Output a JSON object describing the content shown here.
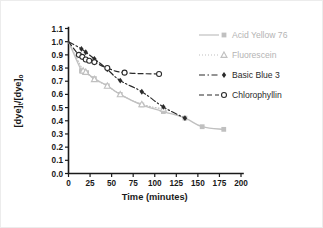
{
  "figure": {
    "background": "#ffffff",
    "border_color": "#ececec"
  },
  "axes": {
    "x": {
      "title": "Time (minutes)",
      "ticks": [
        "0",
        "25",
        "50",
        "75",
        "100",
        "125",
        "150",
        "175",
        "200"
      ],
      "min": 0,
      "max": 200
    },
    "y": {
      "title_main": "[dye]",
      "title_sub_t": "t",
      "title_slash": "/[dye]",
      "title_sub_o": "o",
      "ticks": [
        "0.0",
        "0.1",
        "0.2",
        "0.3",
        "0.4",
        "0.5",
        "0.6",
        "0.7",
        "0.8",
        "0.9",
        "1.0",
        "1.1"
      ],
      "min": 0.0,
      "max": 1.1
    }
  },
  "legend": {
    "entries": [
      {
        "label": "Acid Yellow 76",
        "color": "#c0c0c0",
        "text_color": "#b4b4b4",
        "dash": "none",
        "marker": "filled-square"
      },
      {
        "label": "Fluorescein",
        "color": "#c0c0c0",
        "text_color": "#b4b4b4",
        "dash": "dotted",
        "marker": "open-triangle"
      },
      {
        "label": "Basic Blue 3",
        "color": "#2b2b2b",
        "text_color": "#2b2b2b",
        "dash": "dashdot",
        "marker": "filled-diamond"
      },
      {
        "label": "Chlorophyllin",
        "color": "#2b2b2b",
        "text_color": "#2b2b2b",
        "dash": "dashed",
        "marker": "open-circle"
      }
    ]
  },
  "chart_data": {
    "type": "line",
    "title": "",
    "xlabel": "Time (minutes)",
    "ylabel": "[dye]t/[dye]o",
    "xlim": [
      0,
      200
    ],
    "ylim": [
      0.0,
      1.1
    ],
    "grid": false,
    "legend_position": "top-right",
    "series": [
      {
        "name": "Acid Yellow 76",
        "color": "#c0c0c0",
        "dash": "none",
        "marker": "filled-square",
        "x": [
          0,
          15,
          18,
          21,
          30,
          45,
          60,
          85,
          110,
          135,
          155,
          180
        ],
        "y": [
          1.0,
          0.78,
          0.775,
          0.765,
          0.72,
          0.665,
          0.6,
          0.52,
          0.47,
          0.42,
          0.355,
          0.335
        ]
      },
      {
        "name": "Fluorescein",
        "color": "#c0c0c0",
        "dash": "dotted",
        "marker": "open-triangle",
        "x": [
          0,
          17,
          20,
          30,
          45,
          60,
          85,
          110
        ],
        "y": [
          1.0,
          0.78,
          0.77,
          0.715,
          0.665,
          0.6,
          0.525,
          0.49
        ]
      },
      {
        "name": "Basic Blue 3",
        "color": "#2b2b2b",
        "dash": "dashdot",
        "marker": "filled-diamond",
        "x": [
          0,
          15,
          20,
          30,
          45,
          60,
          85,
          110,
          135
        ],
        "y": [
          1.0,
          0.945,
          0.92,
          0.87,
          0.79,
          0.705,
          0.62,
          0.505,
          0.42
        ]
      },
      {
        "name": "Chlorophyllin",
        "color": "#2b2b2b",
        "dash": "dashed",
        "marker": "open-circle",
        "x": [
          0,
          12,
          16,
          20,
          24,
          30,
          45,
          65,
          105
        ],
        "y": [
          1.0,
          0.9,
          0.885,
          0.865,
          0.855,
          0.845,
          0.8,
          0.765,
          0.755
        ]
      }
    ]
  }
}
